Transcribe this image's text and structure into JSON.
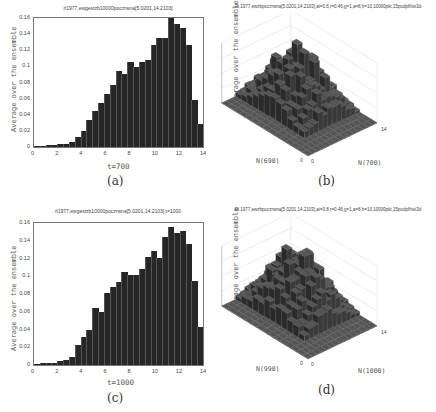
{
  "figure": {
    "captions": [
      "(a)",
      "(b)",
      "(c)",
      "(d)"
    ]
  },
  "chart_data": [
    {
      "id": "a",
      "type": "bar",
      "title": "rl1977,ewgestzb10000poczrwna[5.0201,14.2103]",
      "xlabel": "t=700",
      "ylabel": "Average over the ensemble",
      "xlim": [
        0,
        14
      ],
      "ylim": [
        0,
        0.16
      ],
      "xticks": [
        "0",
        "2",
        "4",
        "6",
        "8",
        "10",
        "12",
        "14"
      ],
      "yticks": [
        "0",
        "0.02",
        "0.04",
        "0.06",
        "0.08",
        "0.1",
        "0.12",
        "0.14",
        "0.16"
      ],
      "bin_width": 0.5,
      "x": [
        0.25,
        0.75,
        1.25,
        1.75,
        2.25,
        2.75,
        3.25,
        3.75,
        4.25,
        4.75,
        5.25,
        5.75,
        6.25,
        6.75,
        7.25,
        7.75,
        8.25,
        8.75,
        9.25,
        9.75,
        10.25,
        10.75,
        11.25,
        11.75,
        12.25,
        12.75,
        13.25,
        13.75
      ],
      "values": [
        0.001,
        0.001,
        0.002,
        0.003,
        0.004,
        0.004,
        0.006,
        0.013,
        0.02,
        0.034,
        0.045,
        0.055,
        0.066,
        0.077,
        0.094,
        0.091,
        0.106,
        0.099,
        0.106,
        0.108,
        0.127,
        0.135,
        0.135,
        0.16,
        0.153,
        0.148,
        0.127,
        0.058
      ],
      "extra_last_bar": 0.029,
      "grid": false
    },
    {
      "id": "b",
      "type": "bar3d",
      "title": "Rl,1977,ewzbpoczrwna[5.0201,14.2103],ai=0.8,r=0.46,g=1,a=8,h=10,10000pkt,15podpfhist3d",
      "xlabel": "N(700)",
      "ylabel": "N(690)",
      "zlabel": "Average over the ensemble",
      "zticks": [
        "0",
        "2",
        "4",
        "6",
        "8"
      ],
      "xtick_ends": [
        "0",
        "14"
      ],
      "ytick_ends": [
        "0",
        "14"
      ],
      "zlim": [
        0,
        8
      ],
      "grid": true
    },
    {
      "id": "c",
      "type": "bar",
      "title": "rl1977,ewgestzb10000poczrwna[5.0201,14.2103],t=1000",
      "xlabel": "t=1000",
      "ylabel": "Average over the ensemble",
      "xlim": [
        0,
        14
      ],
      "ylim": [
        0,
        0.16
      ],
      "xticks": [
        "0",
        "2",
        "4",
        "6",
        "8",
        "10",
        "12",
        "14"
      ],
      "yticks": [
        "0",
        "0.02",
        "0.04",
        "0.06",
        "0.08",
        "0.1",
        "0.12",
        "0.14",
        "0.16"
      ],
      "bin_width": 0.5,
      "x": [
        0.25,
        0.75,
        1.25,
        1.75,
        2.25,
        2.75,
        3.25,
        3.75,
        4.25,
        4.75,
        5.25,
        5.75,
        6.25,
        6.75,
        7.25,
        7.75,
        8.25,
        8.75,
        9.25,
        9.75,
        10.25,
        10.75,
        11.25,
        11.75,
        12.25,
        12.75,
        13.25,
        13.75
      ],
      "values": [
        0.001,
        0.002,
        0.002,
        0.002,
        0.004,
        0.006,
        0.009,
        0.023,
        0.032,
        0.039,
        0.064,
        0.06,
        0.081,
        0.088,
        0.094,
        0.105,
        0.101,
        0.101,
        0.108,
        0.122,
        0.129,
        0.121,
        0.144,
        0.155,
        0.149,
        0.151,
        0.136,
        0.095
      ],
      "extra_last_bar": 0.043,
      "grid": false
    },
    {
      "id": "d",
      "type": "bar3d",
      "title": "Rl,1977,ewzbpoczrwna[5.0201,14.2103],ai=0.8,r=0.46,g=1,a=8,h=10,10000pkt,15podpfhist3d",
      "xlabel": "N(1000)",
      "ylabel": "N(990)",
      "zlabel": "Average over the ensemble",
      "zticks": [
        "0",
        "2",
        "4",
        "6",
        "8"
      ],
      "xtick_ends": [
        "0",
        "14"
      ],
      "ytick_ends": [
        "0",
        "14"
      ],
      "zlim": [
        0,
        8
      ],
      "grid": true
    }
  ]
}
